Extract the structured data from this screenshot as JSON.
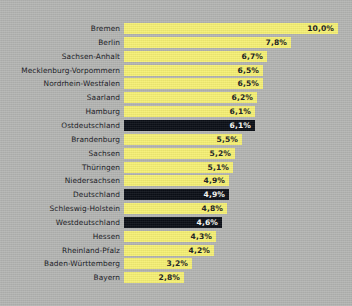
{
  "chart_data": {
    "type": "bar",
    "orientation": "horizontal",
    "title": "",
    "subtitle": "",
    "xlabel": "",
    "ylabel": "",
    "xlim": [
      0,
      10.6
    ],
    "grid": false,
    "legend": null,
    "unit": "%",
    "decimal_separator": ",",
    "categories": [
      "Bremen",
      "Berlin",
      "Sachsen-Anhalt",
      "Mecklenburg-Vorpommern",
      "Nordrhein-Westfalen",
      "Saarland",
      "Hamburg",
      "Ostdeutschland",
      "Brandenburg",
      "Sachsen",
      "Thüringen",
      "Niedersachsen",
      "Deutschland",
      "Schleswig-Holstein",
      "Westdeutschland",
      "Hessen",
      "Rheinland-Pfalz",
      "Baden-Württemberg",
      "Bayern"
    ],
    "values": [
      10.0,
      7.8,
      6.7,
      6.5,
      6.5,
      6.2,
      6.1,
      6.1,
      5.5,
      5.2,
      5.1,
      4.9,
      4.9,
      4.8,
      4.6,
      4.3,
      4.2,
      3.2,
      2.8
    ],
    "value_labels": [
      "10,0%",
      "7,8%",
      "6,7%",
      "6,5%",
      "6,5%",
      "6,2%",
      "6,1%",
      "6,1%",
      "5,5%",
      "5,2%",
      "5,1%",
      "4,9%",
      "4,9%",
      "4,8%",
      "4,6%",
      "4,3%",
      "4,2%",
      "3,2%",
      "2,8%"
    ],
    "highlighted": [
      "Ostdeutschland",
      "Deutschland",
      "Westdeutschland"
    ],
    "colors": {
      "background": "#b4b5b3",
      "bar": "#f6f074",
      "bar_highlight": "#0b0f17",
      "label_text": "#14161c",
      "value_text_on_bar": "#16181d",
      "value_text_on_highlight": "#fafbf6"
    }
  }
}
